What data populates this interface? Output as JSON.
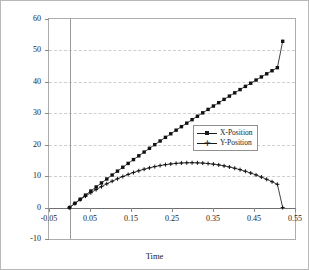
{
  "chart_data": {
    "type": "scatter",
    "title": "",
    "xlabel": "Time",
    "ylabel": "",
    "xlim": [
      -0.05,
      0.55
    ],
    "ylim": [
      -10,
      60
    ],
    "xticks": [
      "-0.05",
      "0.05",
      "0.15",
      "0.25",
      "0.35",
      "0.45",
      "0.55"
    ],
    "xtick_values": [
      -0.05,
      0.05,
      0.15,
      0.25,
      0.35,
      0.45,
      0.55
    ],
    "yticks": [
      "-10",
      "0",
      "10",
      "20",
      "30",
      "40",
      "50",
      "60"
    ],
    "ytick_values": [
      -10,
      0,
      10,
      20,
      30,
      40,
      50,
      60
    ],
    "grid": true,
    "grid_axis": "y",
    "legend_position": "center-right",
    "marker_color": "#111111",
    "gridline_color": "#cfcfcf",
    "frame_color": "#adadad",
    "series": [
      {
        "name": "X-Position",
        "marker": "square",
        "x": [
          0,
          0.013,
          0.026,
          0.039,
          0.052,
          0.065,
          0.078,
          0.091,
          0.104,
          0.117,
          0.13,
          0.143,
          0.156,
          0.169,
          0.182,
          0.195,
          0.208,
          0.221,
          0.234,
          0.247,
          0.26,
          0.273,
          0.286,
          0.299,
          0.312,
          0.325,
          0.338,
          0.351,
          0.364,
          0.377,
          0.39,
          0.403,
          0.416,
          0.429,
          0.442,
          0.455,
          0.468,
          0.481,
          0.494,
          0.507,
          0.52
        ],
        "values": [
          0,
          1.33,
          2.65,
          3.96,
          5.26,
          6.55,
          7.83,
          9.09,
          10.35,
          11.59,
          12.83,
          14.05,
          15.27,
          16.47,
          17.66,
          18.85,
          20.02,
          21.18,
          22.34,
          23.48,
          24.62,
          25.74,
          26.86,
          27.97,
          29.06,
          30.15,
          31.23,
          32.31,
          33.37,
          34.42,
          35.47,
          36.51,
          37.54,
          38.56,
          39.57,
          40.57,
          41.57,
          42.56,
          43.54,
          44.51,
          52.9
        ]
      },
      {
        "name": "Y-Position",
        "marker": "plus",
        "x": [
          0,
          0.013,
          0.026,
          0.039,
          0.052,
          0.065,
          0.078,
          0.091,
          0.104,
          0.117,
          0.13,
          0.143,
          0.156,
          0.169,
          0.182,
          0.195,
          0.208,
          0.221,
          0.234,
          0.247,
          0.26,
          0.273,
          0.286,
          0.299,
          0.312,
          0.325,
          0.338,
          0.351,
          0.364,
          0.377,
          0.39,
          0.403,
          0.416,
          0.429,
          0.442,
          0.455,
          0.468,
          0.481,
          0.494,
          0.507,
          0.52
        ],
        "values": [
          0,
          1.3,
          2.5,
          3.64,
          4.71,
          5.72,
          6.67,
          7.56,
          8.39,
          9.16,
          9.88,
          10.54,
          11.15,
          11.7,
          12.2,
          12.64,
          13.03,
          13.37,
          13.65,
          13.88,
          14.06,
          14.18,
          14.25,
          14.27,
          14.24,
          14.15,
          14.01,
          13.82,
          13.57,
          13.27,
          12.92,
          12.52,
          12.06,
          11.55,
          10.99,
          10.38,
          9.71,
          8.99,
          8.22,
          7.4,
          0.0
        ]
      }
    ]
  },
  "axis": {
    "x_title": "Time"
  },
  "legend": {
    "entries": [
      {
        "label": "X-Position",
        "marker": "square"
      },
      {
        "label": "Y-Position",
        "marker": "plus"
      }
    ]
  }
}
